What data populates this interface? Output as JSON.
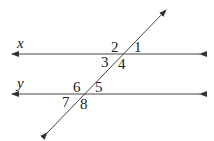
{
  "diagram": {
    "type": "parallel-lines-transversal",
    "lines": [
      {
        "id": "x",
        "label": "x",
        "y": 54,
        "x1": 12,
        "x2": 200
      },
      {
        "id": "y",
        "label": "y",
        "y": 94,
        "x1": 12,
        "x2": 200
      }
    ],
    "transversal": {
      "x1": 47,
      "y1": 133,
      "x2": 166,
      "y2": 10
    },
    "angles": [
      {
        "label": "1",
        "x": 134,
        "y": 41
      },
      {
        "label": "2",
        "x": 111,
        "y": 41
      },
      {
        "label": "3",
        "x": 101,
        "y": 55
      },
      {
        "label": "4",
        "x": 118,
        "y": 57
      },
      {
        "label": "5",
        "x": 94,
        "y": 81
      },
      {
        "label": "6",
        "x": 73,
        "y": 81
      },
      {
        "label": "7",
        "x": 62,
        "y": 95
      },
      {
        "label": "8",
        "x": 79,
        "y": 97
      }
    ],
    "stroke_color": "#333333"
  }
}
